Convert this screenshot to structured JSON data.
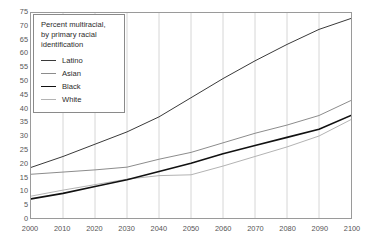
{
  "chart_data": {
    "type": "line",
    "title": "Percent multiracial, by primary racial identification",
    "xlabel": "",
    "ylabel": "",
    "xlim": [
      2000,
      2100
    ],
    "ylim": [
      0,
      75
    ],
    "ytick_step": 5,
    "xtick_step": 10,
    "grid": "vertical",
    "legend_position": "top-left",
    "x": [
      2000,
      2010,
      2020,
      2030,
      2040,
      2050,
      2060,
      2070,
      2080,
      2090,
      2100
    ],
    "categories": [
      "2000",
      "2010",
      "2020",
      "2030",
      "2040",
      "2050",
      "2060",
      "2070",
      "2080",
      "2090",
      "2100"
    ],
    "yticks": [
      0,
      5,
      10,
      15,
      20,
      25,
      30,
      35,
      40,
      45,
      50,
      55,
      60,
      65,
      70,
      75
    ],
    "xticks": [
      2000,
      2010,
      2020,
      2030,
      2040,
      2050,
      2060,
      2070,
      2080,
      2090,
      2100
    ],
    "series": [
      {
        "name": "Latino",
        "color": "#3a3a3a",
        "width": 1.0,
        "values": [
          18.5,
          22.5,
          27.0,
          31.5,
          37.0,
          44.0,
          51.0,
          57.5,
          63.5,
          69.0,
          73.0
        ]
      },
      {
        "name": "Asian",
        "color": "#8c8c8c",
        "width": 1.0,
        "values": [
          16.0,
          16.8,
          17.6,
          18.6,
          21.5,
          24.0,
          27.5,
          31.0,
          34.0,
          37.5,
          43.0
        ]
      },
      {
        "name": "Black",
        "color": "#111111",
        "width": 1.6,
        "values": [
          7.0,
          9.0,
          11.5,
          14.0,
          17.0,
          20.0,
          23.5,
          26.5,
          29.5,
          32.5,
          37.5
        ]
      },
      {
        "name": "White",
        "color": "#b3b3b3",
        "width": 1.0,
        "values": [
          8.0,
          10.2,
          12.2,
          14.2,
          15.5,
          15.8,
          19.0,
          22.5,
          26.0,
          30.0,
          36.0
        ]
      }
    ]
  },
  "legend": {
    "title": "Percent multiracial,\nby primary racial\nidentification",
    "entries": [
      {
        "label": "Latino"
      },
      {
        "label": "Asian"
      },
      {
        "label": "Black"
      },
      {
        "label": "White"
      }
    ]
  },
  "axes": {
    "y_labels": [
      "75",
      "70",
      "65",
      "60",
      "55",
      "50",
      "45",
      "40",
      "35",
      "30",
      "25",
      "20",
      "15",
      "10",
      "5",
      "0"
    ],
    "x_labels": [
      "2000",
      "2010",
      "2020",
      "2030",
      "2040",
      "2050",
      "2060",
      "2070",
      "2080",
      "2090",
      "2100"
    ]
  },
  "style": {
    "grid_color": "#d6d6d6",
    "frame_color": "#9a9a9a",
    "tick_text_color": "#555555",
    "background": "#ffffff"
  }
}
